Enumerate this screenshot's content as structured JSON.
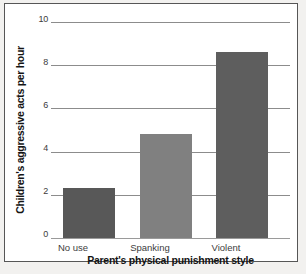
{
  "chart_data": {
    "type": "bar",
    "title": "",
    "xlabel": "Parent's physical punishment style",
    "ylabel": "Children's aggressive acts per hour",
    "categories": [
      "No use",
      "Spanking",
      "Violent"
    ],
    "values": [
      2.3,
      4.8,
      8.6
    ],
    "series": [
      {
        "name": "Children's aggressive acts per hour",
        "values": [
          2.3,
          4.8,
          8.6
        ]
      }
    ],
    "ylim": [
      0,
      10
    ],
    "yticks": [
      0,
      2,
      4,
      6,
      8,
      10
    ],
    "ytick_labels": [
      "0",
      "2",
      "4",
      "6",
      "8",
      "10"
    ],
    "grid": true,
    "legend": false,
    "legend_position": "none",
    "bar_colors": [
      "#585858",
      "#808080",
      "#5e5e5e"
    ],
    "gridline_color": "#8c8c8c",
    "background_color": "#ffffff",
    "frame_color": "#565656"
  }
}
